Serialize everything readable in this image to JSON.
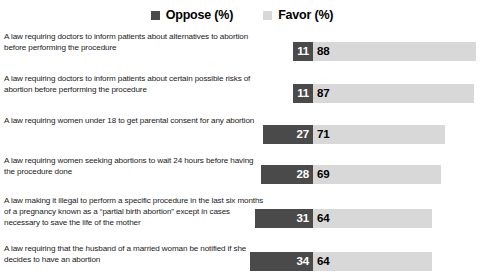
{
  "legend": {
    "entries": [
      {
        "label": "Oppose (%)",
        "color": "#4a4a4a",
        "icon": "square-swatch-dark"
      },
      {
        "label": "Favor (%)",
        "color": "#d8d8d8",
        "icon": "square-swatch-light"
      }
    ]
  },
  "chart_data": {
    "type": "bar",
    "title": "",
    "xlabel": "",
    "ylabel": "",
    "orientation": "horizontal",
    "layout": "diverging-stacked",
    "grid": false,
    "legend_position": "top-center",
    "xlim": [
      0,
      100
    ],
    "categories": [
      "A law requiring doctors to inform patients about alternatives to abortion before performing the procedure",
      "A law requiring doctors to inform patients about certain possible risks of abortion before performing the procedure",
      "A law requiring women under 18 to get parental consent for any abortion",
      "A law requiring women seeking abortions to wait 24 hours before having the procedure done",
      "A law making it illegal to perform a specific procedure in the last six months of a pregnancy known as a “partial birth abortion” except in cases necessary to save the life of the mother",
      "A law requiring that the husband of a married woman be notified if she decides to have an abortion"
    ],
    "series": [
      {
        "name": "Oppose (%)",
        "color": "#4a4a4a",
        "values": [
          11,
          11,
          27,
          28,
          31,
          34
        ]
      },
      {
        "name": "Favor (%)",
        "color": "#d8d8d8",
        "values": [
          88,
          87,
          71,
          69,
          64,
          64
        ]
      }
    ]
  },
  "rows": [
    {
      "label": "A law requiring doctors to inform patients about alternatives to abortion before performing the procedure",
      "oppose": 11,
      "favor": 88
    },
    {
      "label": "A law requiring doctors to inform patients about certain possible risks of abortion before performing the procedure",
      "oppose": 11,
      "favor": 87
    },
    {
      "label": "A law requiring women under 18 to get parental consent for any abortion",
      "oppose": 27,
      "favor": 71
    },
    {
      "label": "A law requiring women seeking abortions to wait 24 hours before having the procedure done",
      "oppose": 28,
      "favor": 69
    },
    {
      "label": "A law making it illegal to perform a specific procedure in the last six months of a pregnancy known as a “partial birth abortion” except in cases necessary to save the life of the mother",
      "oppose": 31,
      "favor": 64
    },
    {
      "label": "A law requiring that the husband of a married woman be notified if she decides to have an abortion",
      "oppose": 34,
      "favor": 64
    }
  ]
}
